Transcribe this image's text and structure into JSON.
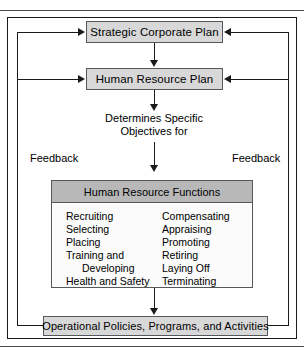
{
  "figure": {
    "boxes": {
      "strategic_plan": "Strategic Corporate Plan",
      "human_resource_plan": "Human Resource Plan",
      "operational": "Operational Policies, Programs, and Activities"
    },
    "caption": {
      "line1": "Determines Specific",
      "line2": "Objectives for"
    },
    "feedback": {
      "left_label": "Feedback",
      "right_label": "Feedback"
    },
    "functions_panel": {
      "header": "Human Resource Functions",
      "left_column": [
        "Recruiting",
        "Selecting",
        "Placing",
        "Training and",
        "Developing",
        "Health and Safety"
      ],
      "right_column": [
        "Compensating",
        "Appraising",
        "Promoting",
        "Retiring",
        "Laying Off",
        "Terminating"
      ]
    },
    "colors": {
      "box_fill": "#d8d8d8",
      "header_fill": "#b8b8b8",
      "panel_fill": "#fbfbfb",
      "line": "#1a1a1a",
      "box_border": "#55585a"
    }
  }
}
